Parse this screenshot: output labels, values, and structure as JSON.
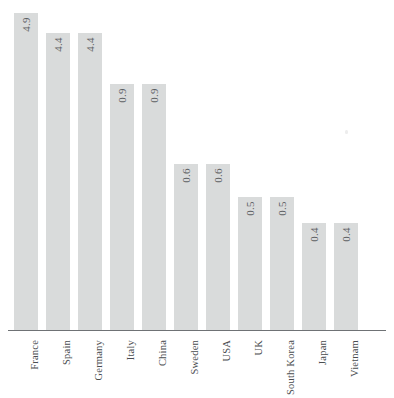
{
  "chart_data": {
    "type": "bar",
    "title": "",
    "subtitle": "",
    "xlabel": "",
    "ylabel": "",
    "grid": false,
    "legend": false,
    "axis": {
      "baseline_visible": true,
      "y_axis_visible": false,
      "y_ticks": []
    },
    "orientation": "vertical",
    "value_label_rotation_deg": -90,
    "category_label_rotation_deg": -90,
    "categories": [
      "France",
      "Spain",
      "Germany",
      "Italy",
      "China",
      "Sweden",
      "USA",
      "UK",
      "South Korea",
      "Japan",
      "Vietnam"
    ],
    "values": [
      4.9,
      4.4,
      4.4,
      0.9,
      0.9,
      0.6,
      0.6,
      0.5,
      0.5,
      0.4,
      0.4
    ],
    "value_labels": [
      "4.9",
      "4.4",
      "4.4",
      "0.9",
      "0.9",
      "0.6",
      "0.6",
      "0.5",
      "0.5",
      "0.4",
      "0.4"
    ],
    "bar_pixel_heights": [
      318,
      298,
      298,
      247,
      247,
      167,
      167,
      134,
      134,
      108,
      108
    ],
    "bars": [
      {
        "category": "France",
        "value": 4.9,
        "label": "4.9",
        "height_px": 318
      },
      {
        "category": "Spain",
        "value": 4.4,
        "label": "4.4",
        "height_px": 298
      },
      {
        "category": "Germany",
        "value": 4.4,
        "label": "4.4",
        "height_px": 298
      },
      {
        "category": "Italy",
        "value": 0.9,
        "label": "0.9",
        "height_px": 247
      },
      {
        "category": "China",
        "value": 0.9,
        "label": "0.9",
        "height_px": 247
      },
      {
        "category": "Sweden",
        "value": 0.6,
        "label": "0.6",
        "height_px": 167
      },
      {
        "category": "USA",
        "value": 0.6,
        "label": "0.6",
        "height_px": 167
      },
      {
        "category": "UK",
        "value": 0.5,
        "label": "0.5",
        "height_px": 134
      },
      {
        "category": "South Korea",
        "value": 0.5,
        "label": "0.5",
        "height_px": 134
      },
      {
        "category": "Japan",
        "value": 0.4,
        "label": "0.4",
        "height_px": 108
      },
      {
        "category": "Vietnam",
        "value": 0.4,
        "label": "0.4",
        "height_px": 108
      }
    ],
    "colors": {
      "bar_fill": "#d9dbdb",
      "background": "#ffffff",
      "axis_line": "#6f7275",
      "value_text": "#5d6063",
      "category_text": "#4a4d50"
    }
  }
}
